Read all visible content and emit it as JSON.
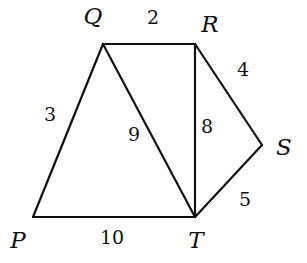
{
  "diagram": {
    "vertices": [
      {
        "id": "Q",
        "label": "Q",
        "x": 103,
        "y": 44,
        "lx": 93,
        "ly": 24
      },
      {
        "id": "R",
        "label": "R",
        "x": 195,
        "y": 44,
        "lx": 210,
        "ly": 32
      },
      {
        "id": "S",
        "label": "S",
        "x": 262,
        "y": 145,
        "lx": 284,
        "ly": 155
      },
      {
        "id": "T",
        "label": "T",
        "x": 195,
        "y": 217,
        "lx": 196,
        "ly": 248
      },
      {
        "id": "P",
        "label": "P",
        "x": 33,
        "y": 217,
        "lx": 18,
        "ly": 248
      }
    ],
    "edges": [
      {
        "from": "Q",
        "to": "R",
        "weight": "2",
        "lx": 153,
        "ly": 24
      },
      {
        "from": "R",
        "to": "S",
        "weight": "4",
        "lx": 243,
        "ly": 76
      },
      {
        "from": "S",
        "to": "T",
        "weight": "5",
        "lx": 245,
        "ly": 206
      },
      {
        "from": "R",
        "to": "T",
        "weight": "8",
        "lx": 207,
        "ly": 133
      },
      {
        "from": "Q",
        "to": "T",
        "weight": "9",
        "lx": 134,
        "ly": 141
      },
      {
        "from": "Q",
        "to": "P",
        "weight": "3",
        "lx": 50,
        "ly": 121
      },
      {
        "from": "P",
        "to": "T",
        "weight": "10",
        "lx": 112,
        "ly": 244
      }
    ]
  }
}
